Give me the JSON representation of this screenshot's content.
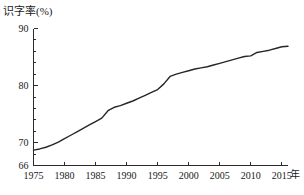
{
  "chart_data": {
    "type": "line",
    "title": "",
    "ylabel": "识字率(%)",
    "xlabel": "年",
    "xlim": [
      1975,
      2016
    ],
    "ylim": [
      66,
      90
    ],
    "yticks": [
      66,
      70,
      80,
      90
    ],
    "ytick_labels": [
      "66",
      "70",
      "80",
      "90"
    ],
    "yminor_step": 2,
    "xticks": [
      1975,
      1980,
      1985,
      1990,
      1995,
      2000,
      2005,
      2010,
      2015
    ],
    "xtick_labels": [
      "1975",
      "1980",
      "1985",
      "1990",
      "1995",
      "2000",
      "2005",
      "2010",
      "2015"
    ],
    "grid": false,
    "legend": null,
    "series": [
      {
        "name": "识字率",
        "color": "#262626",
        "x": [
          1975,
          1976,
          1977,
          1978,
          1979,
          1980,
          1981,
          1982,
          1983,
          1984,
          1985,
          1986,
          1987,
          1988,
          1989,
          1990,
          1991,
          1992,
          1993,
          1994,
          1995,
          1996,
          1997,
          1998,
          1999,
          2000,
          2001,
          2002,
          2003,
          2004,
          2005,
          2006,
          2007,
          2008,
          2009,
          2010,
          2011,
          2012,
          2013,
          2014,
          2015,
          2016
        ],
        "y": [
          68.7,
          68.9,
          69.2,
          69.6,
          70.1,
          70.7,
          71.3,
          71.9,
          72.5,
          73.1,
          73.7,
          74.3,
          75.6,
          76.2,
          76.5,
          76.9,
          77.3,
          77.8,
          78.3,
          78.8,
          79.3,
          80.3,
          81.6,
          82.0,
          82.3,
          82.6,
          82.9,
          83.1,
          83.3,
          83.6,
          83.9,
          84.2,
          84.5,
          84.8,
          85.1,
          85.2,
          85.8,
          86.0,
          86.2,
          86.5,
          86.8,
          86.9
        ]
      }
    ]
  }
}
